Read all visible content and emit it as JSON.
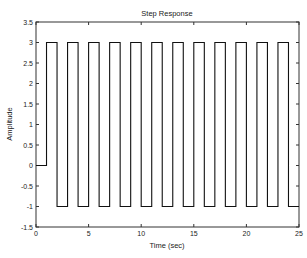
{
  "chart_data": {
    "type": "line",
    "title": "Step Response",
    "xlabel": "Time (sec)",
    "ylabel": "Amplitude",
    "xlim": [
      0,
      25
    ],
    "ylim": [
      -1.5,
      3.5
    ],
    "xticks": [
      0,
      5,
      10,
      15,
      20,
      25
    ],
    "yticks": [
      -1.5,
      -1,
      -0.5,
      0,
      0.5,
      1,
      1.5,
      2,
      2.5,
      3,
      3.5
    ],
    "xtick_labels": [
      "0",
      "5",
      "10",
      "15",
      "20",
      "25"
    ],
    "ytick_labels": [
      "-1.5",
      "-1",
      "-0.5",
      "0",
      "0.5",
      "1",
      "1.5",
      "2",
      "2.5",
      "3",
      "3.5"
    ],
    "grid": false,
    "legend": null,
    "series": [
      {
        "name": "Step Response",
        "color": "#000000",
        "style": "stairs",
        "x": [
          0,
          1,
          1,
          2,
          2,
          3,
          3,
          4,
          4,
          5,
          5,
          6,
          6,
          7,
          7,
          8,
          8,
          9,
          9,
          10,
          10,
          11,
          11,
          12,
          12,
          13,
          13,
          14,
          14,
          15,
          15,
          16,
          16,
          17,
          17,
          18,
          18,
          19,
          19,
          20,
          20,
          21,
          21,
          22,
          22,
          23,
          23,
          24,
          24,
          25
        ],
        "y": [
          0,
          0,
          3,
          3,
          -1,
          -1,
          3,
          3,
          -1,
          -1,
          3,
          3,
          -1,
          -1,
          3,
          3,
          -1,
          -1,
          3,
          3,
          -1,
          -1,
          3,
          3,
          -1,
          -1,
          3,
          3,
          -1,
          -1,
          3,
          3,
          -1,
          -1,
          3,
          3,
          -1,
          -1,
          3,
          3,
          -1,
          -1,
          3,
          3,
          -1,
          -1,
          3,
          3,
          -1,
          -1
        ]
      }
    ]
  },
  "plot_box": {
    "left": 36,
    "right": 299,
    "top": 22,
    "bottom": 227
  }
}
